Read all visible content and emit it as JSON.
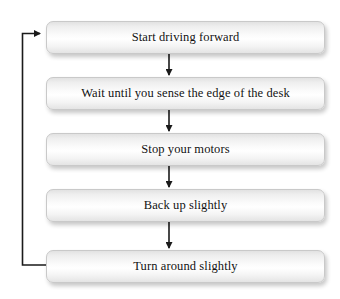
{
  "diagram": {
    "type": "flowchart",
    "title": "",
    "background_color": "#ffffff",
    "node_fill_color": "#f4f4f4",
    "node_border_color": "#c9c9c9",
    "text_color": "#121212",
    "connector_color": "#1a1a1a",
    "nodes": [
      {
        "id": "step-1",
        "label": "Start driving forward"
      },
      {
        "id": "step-2",
        "label": "Wait until you sense the edge of the desk"
      },
      {
        "id": "step-3",
        "label": "Stop your motors"
      },
      {
        "id": "step-4",
        "label": "Back up slightly"
      },
      {
        "id": "step-5",
        "label": "Turn around slightly"
      }
    ],
    "connectors": [
      {
        "from": "step-1",
        "to": "step-2",
        "kind": "arrow-down"
      },
      {
        "from": "step-2",
        "to": "step-3",
        "kind": "arrow-down"
      },
      {
        "from": "step-3",
        "to": "step-4",
        "kind": "arrow-down"
      },
      {
        "from": "step-4",
        "to": "step-5",
        "kind": "arrow-down"
      },
      {
        "from": "step-5",
        "to": "step-1",
        "kind": "loop-back-left"
      }
    ]
  }
}
